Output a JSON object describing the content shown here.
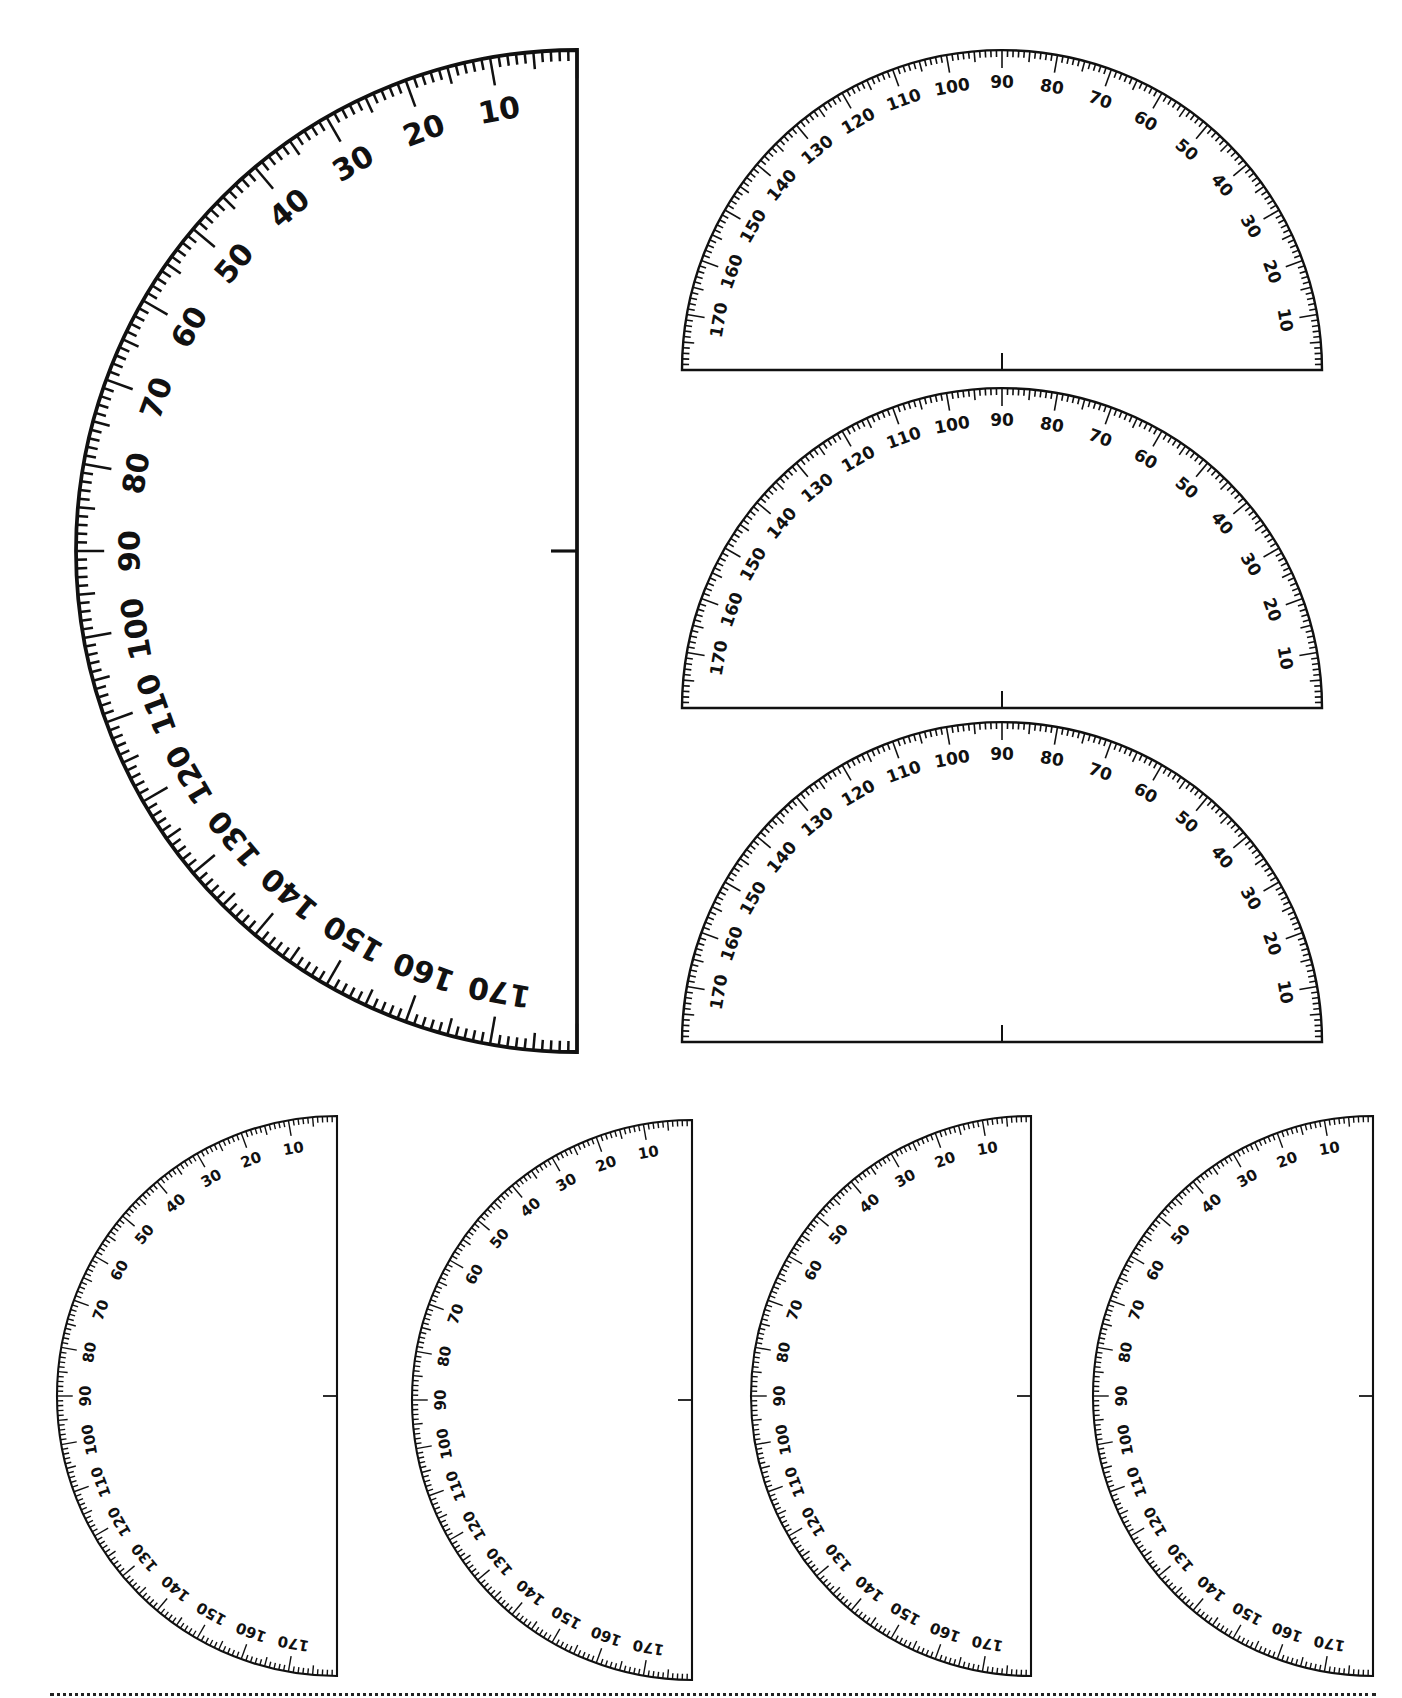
{
  "page": {
    "background": "#ffffff",
    "ink_color": "#111111"
  },
  "scale": {
    "label_step_deg": 10,
    "minor_tick_deg": 1,
    "medium_tick_deg": 5,
    "labels": [
      "10",
      "20",
      "30",
      "40",
      "50",
      "60",
      "70",
      "80",
      "90",
      "100",
      "110",
      "120",
      "130",
      "140",
      "150",
      "160",
      "170"
    ]
  },
  "protractors": [
    {
      "id": "large-half-left",
      "orientation": "left",
      "cx": 577,
      "cy": 551,
      "r": 501,
      "font_size": 30,
      "center_tick": 26
    },
    {
      "id": "top-half-up-1",
      "orientation": "up",
      "cx": 1002,
      "cy": 370,
      "r": 320,
      "font_size": 17,
      "center_tick": 17
    },
    {
      "id": "top-half-up-2",
      "orientation": "up",
      "cx": 1002,
      "cy": 708,
      "r": 320,
      "font_size": 17,
      "center_tick": 17
    },
    {
      "id": "top-half-up-3",
      "orientation": "up",
      "cx": 1002,
      "cy": 1042,
      "r": 320,
      "font_size": 17,
      "center_tick": 17
    },
    {
      "id": "small-half-left-1",
      "orientation": "left",
      "cx": 337,
      "cy": 1396,
      "r": 280,
      "font_size": 15,
      "center_tick": 14
    },
    {
      "id": "small-half-left-2",
      "orientation": "left",
      "cx": 692,
      "cy": 1400,
      "r": 280,
      "font_size": 15,
      "center_tick": 14
    },
    {
      "id": "small-half-left-3",
      "orientation": "left",
      "cx": 1031,
      "cy": 1396,
      "r": 280,
      "font_size": 15,
      "center_tick": 14
    },
    {
      "id": "small-half-left-4",
      "orientation": "left",
      "cx": 1373,
      "cy": 1396,
      "r": 280,
      "font_size": 15,
      "center_tick": 14
    }
  ],
  "cut_line": {
    "style": "dotted",
    "y": 1695
  }
}
